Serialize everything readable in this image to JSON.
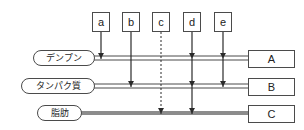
{
  "diagram": {
    "colors": {
      "stroke": "#4b4b4b",
      "line": "#8c8c8c",
      "arrow": "#2a2a2a",
      "background": "#ffffff"
    },
    "agents": [
      {
        "id": "a",
        "label": "a",
        "x": 101,
        "line_style": "solid",
        "targets": [
          "starch"
        ]
      },
      {
        "id": "b",
        "label": "b",
        "x": 131,
        "line_style": "solid",
        "targets": [
          "protein"
        ]
      },
      {
        "id": "c",
        "label": "c",
        "x": 161,
        "line_style": "dashed",
        "targets": [
          "fat"
        ]
      },
      {
        "id": "d",
        "label": "d",
        "x": 192,
        "line_style": "solid",
        "targets": [
          "starch",
          "protein",
          "fat"
        ]
      },
      {
        "id": "e",
        "label": "e",
        "x": 223,
        "line_style": "solid",
        "targets": [
          "starch",
          "protein"
        ]
      }
    ],
    "nutrients": [
      {
        "id": "starch",
        "label": "デンプン",
        "y": 58,
        "pill_left": 33,
        "pill_width": 62,
        "track": "double"
      },
      {
        "id": "protein",
        "label": "タンパク質",
        "y": 86,
        "pill_left": 21,
        "pill_width": 74,
        "track": "double"
      },
      {
        "id": "fat",
        "label": "脂肪",
        "y": 113,
        "pill_left": 37,
        "pill_width": 45,
        "track": "thick"
      }
    ],
    "products": [
      {
        "id": "A",
        "label": "A",
        "y": 50,
        "from": "starch"
      },
      {
        "id": "B",
        "label": "B",
        "y": 78,
        "from": "protein"
      },
      {
        "id": "C",
        "label": "C",
        "y": 105,
        "from": "fat"
      }
    ]
  }
}
